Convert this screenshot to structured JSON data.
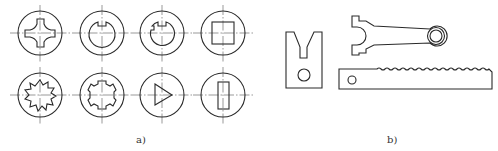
{
  "figure": {
    "panel_a": {
      "label": "a)",
      "description": "Cross-sections of shafts/holes with various inner profiles",
      "shapes": [
        {
          "row": 1,
          "col": 1,
          "name": "cross-profile"
        },
        {
          "row": 1,
          "col": 2,
          "name": "single-keyway-hole"
        },
        {
          "row": 1,
          "col": 3,
          "name": "double-notch-hole"
        },
        {
          "row": 1,
          "col": 4,
          "name": "square-hole"
        },
        {
          "row": 2,
          "col": 1,
          "name": "serrated-spline-hole"
        },
        {
          "row": 2,
          "col": 2,
          "name": "involute-spline-hole"
        },
        {
          "row": 2,
          "col": 3,
          "name": "triangle-hole"
        },
        {
          "row": 2,
          "col": 4,
          "name": "rectangular-slot"
        }
      ]
    },
    "panel_b": {
      "label": "b)",
      "description": "Planar machine parts",
      "shapes": [
        {
          "name": "v-block"
        },
        {
          "name": "connecting-rod"
        },
        {
          "name": "gear-rack"
        }
      ]
    },
    "colors": {
      "line": "#2a2a2a",
      "centerline": "#555555",
      "background": "#ffffff"
    }
  }
}
